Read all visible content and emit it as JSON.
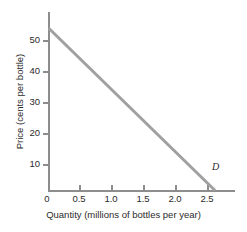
{
  "chart_data": {
    "type": "line",
    "title": "",
    "xlabel": "Quantity (millions of bottles per year)",
    "ylabel": "Price (cents per bottle)",
    "xlim": [
      0,
      2.8
    ],
    "ylim": [
      0,
      55
    ],
    "xticks": [
      "0",
      "0.5",
      "1.0",
      "1.5",
      "2.0",
      "2.5"
    ],
    "xtick_values": [
      0,
      0.5,
      1.0,
      1.5,
      2.0,
      2.5
    ],
    "yticks": [
      "10",
      "20",
      "30",
      "40",
      "50"
    ],
    "ytick_values": [
      10,
      20,
      30,
      40,
      50
    ],
    "grid": false,
    "legend": "none",
    "series": [
      {
        "name": "D",
        "label": "D",
        "color": "#a0a0a0",
        "linewidth": 3,
        "x": [
          0,
          2.5
        ],
        "values": [
          50,
          0
        ],
        "annotation": "D",
        "annotation_x": 2.5,
        "annotation_y": 4
      }
    ]
  },
  "axes": {
    "axis_color": "#8d8d8d",
    "tick_label_color": "#2b2b2b"
  }
}
